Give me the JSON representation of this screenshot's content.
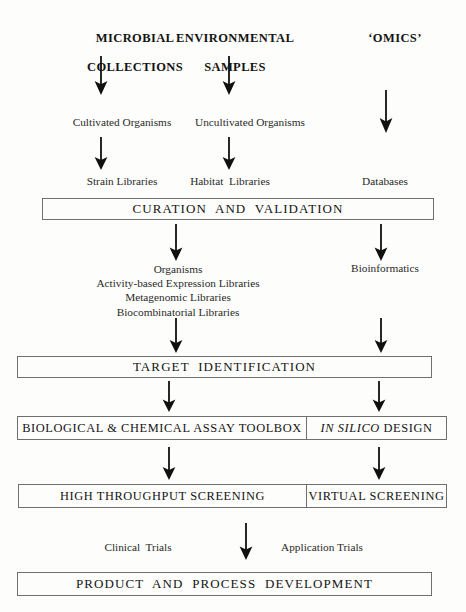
{
  "diagram": {
    "headers": [
      {
        "id": "microbial-collections",
        "line1": "MICROBIAL",
        "line2": "COLLECTIONS"
      },
      {
        "id": "environmental-samples",
        "line1": "ENVIRONMENTAL",
        "line2": "SAMPLES"
      },
      {
        "id": "omics",
        "line1": "‘OMICS’",
        "line2": ""
      }
    ],
    "stage_organisms": [
      {
        "id": "cultivated-organisms",
        "label": "Cultivated Organisms"
      },
      {
        "id": "uncultivated-organisms",
        "label": "Uncultivated Organisms"
      }
    ],
    "stage_libraries": [
      {
        "id": "strain-libraries",
        "label": "Strain Libraries"
      },
      {
        "id": "habitat-libraries",
        "label": "Habitat  Libraries"
      },
      {
        "id": "databases",
        "label": "Databases"
      }
    ],
    "curation_box": {
      "id": "curation-and-validation",
      "label": "CURATION  AND  VALIDATION"
    },
    "stage_outputs": {
      "left_block": "Organisms\nActivity-based Expression Libraries\nMetagenomic Libraries\nBiocombinatorial Libraries",
      "right_label": "Bioinformatics"
    },
    "target_box": {
      "id": "target-identification",
      "label": "TARGET  IDENTIFICATION"
    },
    "assay_box": {
      "id": "assay-toolbox-row",
      "left_label": "BIOLOGICAL & CHEMICAL ASSAY TOOLBOX",
      "right_italic": "IN SILICO",
      "right_plain": " DESIGN"
    },
    "screening_box": {
      "id": "screening-row",
      "left_label": "HIGH THROUGHPUT SCREENING",
      "right_label": "VIRTUAL SCREENING"
    },
    "stage_trials": [
      {
        "id": "clinical-trials",
        "label": "Clinical  Trials"
      },
      {
        "id": "application-trials",
        "label": "Application Trials"
      }
    ],
    "product_box": {
      "id": "product-and-process-development",
      "label": "PRODUCT  AND  PROCESS  DEVELOPMENT"
    },
    "colors": {
      "stroke": "#6f6f6f",
      "arrow": "#101010",
      "text": "#141414",
      "background": "#fdfdfb"
    }
  }
}
